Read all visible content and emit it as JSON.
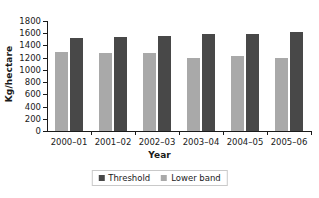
{
  "chart_data": {
    "type": "bar",
    "title": "",
    "xlabel": "Year",
    "ylabel": "Kg/hectare",
    "categories": [
      "2000–01",
      "2001–02",
      "2002–03",
      "2003–04",
      "2004–05",
      "2005–06"
    ],
    "series": [
      {
        "name": "Threshold",
        "color": "#484848",
        "values": [
          1520,
          1535,
          1555,
          1580,
          1590,
          1615
        ]
      },
      {
        "name": "Lower band",
        "color": "#a9a9a9",
        "values": [
          1295,
          1270,
          1270,
          1190,
          1235,
          1190
        ]
      }
    ],
    "series_draw_order": [
      "Lower band",
      "Threshold"
    ],
    "ylim": [
      0,
      1800
    ],
    "yticks": [
      0,
      200,
      400,
      600,
      800,
      1000,
      1200,
      1400,
      1600,
      1800
    ],
    "ytick_labels": [
      "0",
      "200",
      "400",
      "600",
      "800",
      "1000",
      "1200",
      "1400",
      "1600",
      "1800"
    ],
    "grid": false,
    "legend_position": "bottom",
    "background": "#ffffff",
    "axis_color": "#1a1a1a"
  }
}
